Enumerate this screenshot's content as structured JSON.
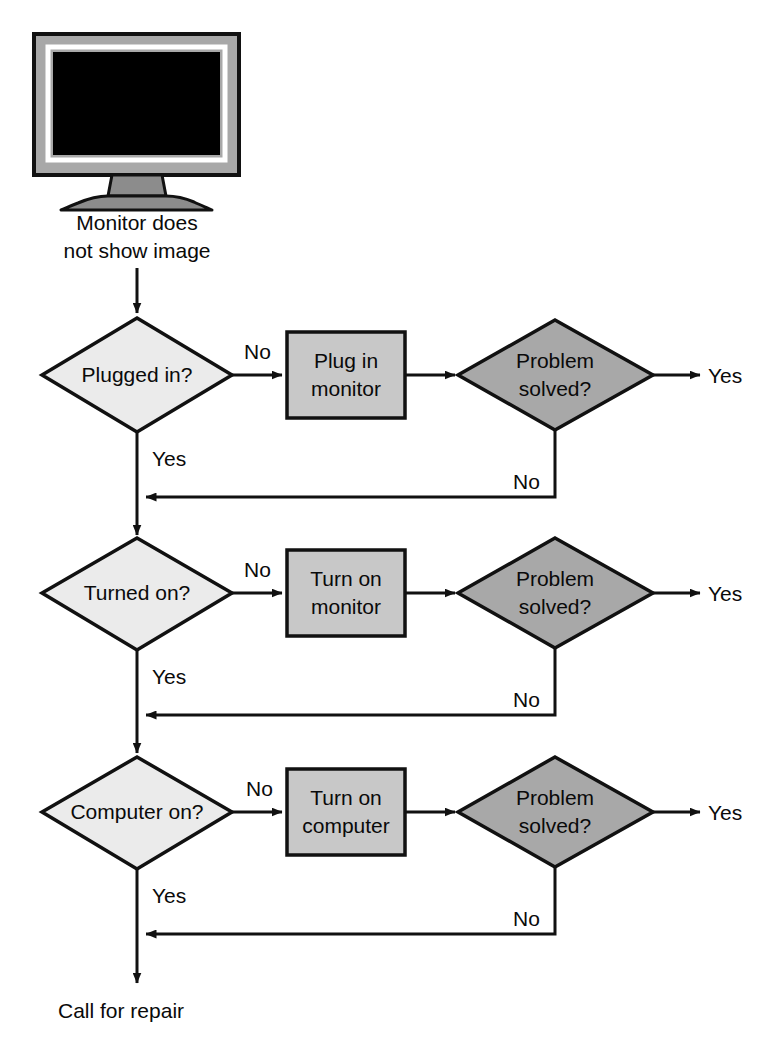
{
  "diagram": {
    "title_caption": "Monitor does not show image",
    "caption_line1": "Monitor does",
    "caption_line2": "not show image",
    "terminal_label": "Call for repair",
    "colors": {
      "outline": "#111111",
      "decision_light_fill": "#ebebeb",
      "decision_dark_fill": "#a8a8a8",
      "process_fill": "#c8c8c8",
      "monitor_bezel": "#a8a8a8",
      "monitor_screen": "#000000",
      "monitor_inner_border": "#ffffff",
      "monitor_stand": "#8c8c8c",
      "background": "#ffffff",
      "text": "#0a0a0a"
    },
    "monitor_icon": {
      "name": "monitor-icon",
      "screen_state": "blank"
    },
    "rows": [
      {
        "id": "row-1",
        "decision": {
          "label": "Plugged in?",
          "label_lines": [
            "Plugged in?"
          ]
        },
        "process": {
          "label": "Plug in monitor",
          "label_lines": [
            "Plug in",
            "monitor"
          ]
        },
        "check": {
          "label": "Problem solved?",
          "label_lines": [
            "Problem",
            "solved?"
          ]
        },
        "edge_no_to_process": "No",
        "edge_yes_down": "Yes",
        "edge_yes_out": "Yes",
        "edge_no_feedback": "No"
      },
      {
        "id": "row-2",
        "decision": {
          "label": "Turned on?",
          "label_lines": [
            "Turned on?"
          ]
        },
        "process": {
          "label": "Turn on monitor",
          "label_lines": [
            "Turn on",
            "monitor"
          ]
        },
        "check": {
          "label": "Problem solved?",
          "label_lines": [
            "Problem",
            "solved?"
          ]
        },
        "edge_no_to_process": "No",
        "edge_yes_down": "Yes",
        "edge_yes_out": "Yes",
        "edge_no_feedback": "No"
      },
      {
        "id": "row-3",
        "decision": {
          "label": "Computer on?",
          "label_lines": [
            "Computer on?"
          ]
        },
        "process": {
          "label": "Turn on computer",
          "label_lines": [
            "Turn on",
            "computer"
          ]
        },
        "check": {
          "label": "Problem solved?",
          "label_lines": [
            "Problem",
            "solved?"
          ]
        },
        "edge_no_to_process": "No",
        "edge_yes_down": "Yes",
        "edge_yes_out": "Yes",
        "edge_no_feedback": "No"
      }
    ]
  }
}
